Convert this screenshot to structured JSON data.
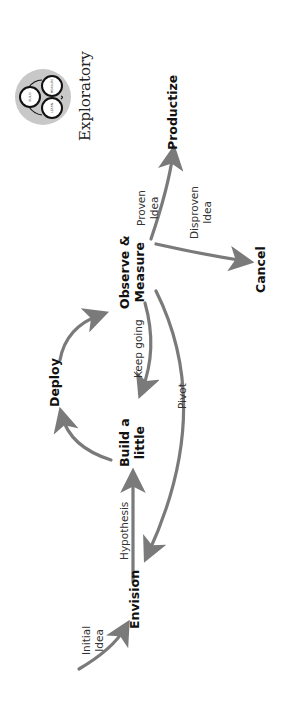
{
  "diagram": {
    "orientation": "rotated-90-ccw",
    "colors": {
      "arrow": "#7a7a7a",
      "text": "#111111",
      "icon_bg": "#c8c8c8"
    },
    "title": "Exploratory",
    "nodes": {
      "envision": "Envision",
      "build_line1": "Build a",
      "build_line2": "little",
      "deploy": "Deploy",
      "observe_line1": "Observe &",
      "observe_line2": "Measure",
      "productize": "Productize",
      "cancel": "Cancel"
    },
    "edges": {
      "initial_line1": "Initial",
      "initial_line2": "Idea",
      "hypothesis": "Hypothesis",
      "keep_going": "Keep going",
      "pivot": "Pivot",
      "proven_line1": "Proven",
      "proven_line2": "Idea",
      "disproven_line1": "Disproven",
      "disproven_line2": "Idea"
    },
    "icon": {
      "name": "cycle-icon",
      "circles": [
        "BUILD",
        "MEASURE",
        "LEARN"
      ]
    }
  }
}
